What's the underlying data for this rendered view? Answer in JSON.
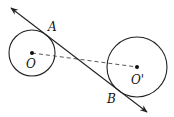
{
  "diagram": {
    "type": "geometry",
    "colors": {
      "stroke": "#222222",
      "background": "#ffffff"
    },
    "circles": [
      {
        "name": "O",
        "cx": 32,
        "cy": 53,
        "r": 23,
        "label": "O"
      },
      {
        "name": "O'",
        "cx": 137,
        "cy": 67,
        "r": 30,
        "label": "O'"
      }
    ],
    "tangent_line": {
      "x1": 10,
      "y1": 7,
      "x2": 147,
      "y2": 112,
      "arrows": "both"
    },
    "points": [
      {
        "name": "A",
        "label": "A"
      },
      {
        "name": "B",
        "label": "B"
      }
    ],
    "dashed_segment": {
      "from": "O",
      "to": "O'"
    }
  }
}
